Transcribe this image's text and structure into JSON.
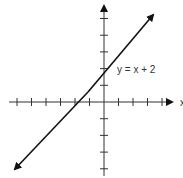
{
  "chart_data": {
    "type": "line",
    "title": "",
    "xlabel": "x",
    "ylabel": "y",
    "annotation": "y = x + 2",
    "series": [
      {
        "name": "y = x + 2",
        "x": [
          -6.3,
          3.5
        ],
        "values": [
          -4.3,
          5.5
        ]
      }
    ],
    "xlim": [
      -6,
      6
    ],
    "ylim": [
      -6,
      6
    ],
    "x_ticks": [
      -6,
      -5,
      -4,
      -3,
      -2,
      -1,
      1,
      2,
      3,
      4
    ],
    "y_ticks": [
      -4,
      -3,
      -2,
      -1,
      1,
      2,
      3,
      4,
      5
    ],
    "grid": false,
    "legend": "none",
    "colors": {
      "line": "#111111",
      "axis": "#333333"
    }
  },
  "labels": {
    "equation": "y = x + 2",
    "x_axis": "x"
  }
}
